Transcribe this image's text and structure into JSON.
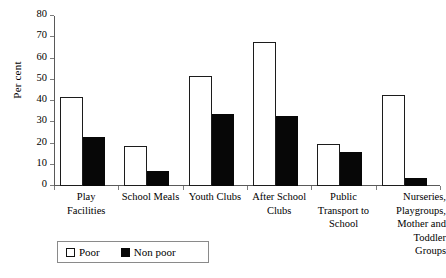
{
  "chart_data": {
    "type": "bar",
    "title": "",
    "xlabel": "",
    "ylabel": "Per cent",
    "ylim": [
      0,
      80
    ],
    "yticks": [
      0,
      10,
      20,
      30,
      40,
      50,
      60,
      70,
      80
    ],
    "grid": false,
    "legend_position": "bottom-left",
    "categories": [
      "Play Facilities",
      "School Meals",
      "Youth Clubs",
      "After School Clubs",
      "Public Transport to School",
      "Nurseries, Playgroups, Mother and Toddler Groups"
    ],
    "category_label_lines": [
      [
        "Play",
        "Facilities"
      ],
      [
        "School Meals"
      ],
      [
        "Youth Clubs"
      ],
      [
        "After School",
        "Clubs"
      ],
      [
        "Public",
        "Transport to",
        "School"
      ],
      [
        "Nurseries,",
        "Playgroups,",
        "Mother and",
        "Toddler",
        "Groups"
      ]
    ],
    "series": [
      {
        "name": "Poor",
        "color": "#ffffff",
        "values": [
          42,
          19,
          52,
          68,
          20,
          43
        ]
      },
      {
        "name": "Non poor",
        "color": "#070707",
        "values": [
          23,
          7,
          34,
          33,
          16,
          4
        ]
      }
    ]
  },
  "legend": {
    "entries": [
      {
        "label": "Poor"
      },
      {
        "label": "Non poor"
      }
    ]
  },
  "icons": {
    "poor_swatch": "empty-square-icon",
    "nonpoor_swatch": "filled-square-icon"
  }
}
